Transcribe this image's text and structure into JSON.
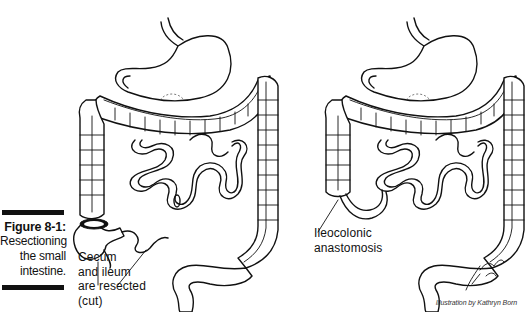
{
  "figure": {
    "number": "Figure 8-1:",
    "caption": "Resectioning the small intestine.",
    "caption_lines": [
      "Resectioning",
      "the small",
      "intestine."
    ]
  },
  "panels": [
    {
      "name": "before-resection",
      "callout": {
        "lines": [
          "Cecum",
          "and ileum",
          "are resected",
          "(cut)"
        ]
      }
    },
    {
      "name": "after-resection",
      "callout": {
        "lines": [
          "Ileocolonic",
          "anastomosis"
        ]
      },
      "signature": "K. Born"
    }
  ],
  "credit": "Illustration by Kathryn Born"
}
